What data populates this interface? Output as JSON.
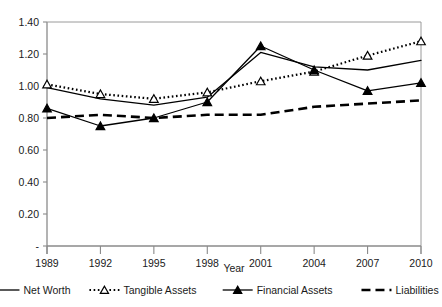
{
  "chart_data": {
    "type": "line",
    "title": "",
    "xlabel": "Year",
    "ylabel": "",
    "categories": [
      "1989",
      "1992",
      "1995",
      "1998",
      "2001",
      "2004",
      "2007",
      "2010"
    ],
    "x": [
      1989,
      1992,
      1995,
      1998,
      2001,
      2004,
      2007,
      2010
    ],
    "ylim": [
      0,
      1.4
    ],
    "ytick_values": [
      0,
      0.2,
      0.4,
      0.6,
      0.8,
      1.0,
      1.2,
      1.4
    ],
    "ytick_labels": [
      "-",
      "0.20",
      "0.40",
      "0.60",
      "0.80",
      "1.00",
      "1.20",
      "1.40"
    ],
    "grid": false,
    "legend_position": "bottom",
    "series": [
      {
        "name": "Net Worth",
        "style": "solid",
        "marker": "none",
        "color": "#000000",
        "values": [
          0.99,
          0.92,
          0.88,
          0.93,
          1.21,
          1.12,
          1.1,
          1.16
        ]
      },
      {
        "name": "Tangible Assets",
        "style": "dotted",
        "marker": "open-triangle",
        "color": "#000000",
        "values": [
          1.01,
          0.95,
          0.92,
          0.96,
          1.03,
          1.09,
          1.19,
          1.28
        ]
      },
      {
        "name": "Financial Assets",
        "style": "solid",
        "marker": "filled-triangle",
        "color": "#000000",
        "values": [
          0.86,
          0.75,
          0.8,
          0.9,
          1.25,
          1.1,
          0.97,
          1.02
        ]
      },
      {
        "name": "Liabilities",
        "style": "dashed",
        "marker": "none",
        "color": "#000000",
        "values": [
          0.8,
          0.82,
          0.8,
          0.82,
          0.82,
          0.87,
          0.89,
          0.91
        ]
      }
    ]
  },
  "legend": {
    "items": [
      {
        "label": "Net Worth"
      },
      {
        "label": "Tangible Assets"
      },
      {
        "label": "Financial Assets"
      },
      {
        "label": "Liabilities"
      }
    ]
  }
}
